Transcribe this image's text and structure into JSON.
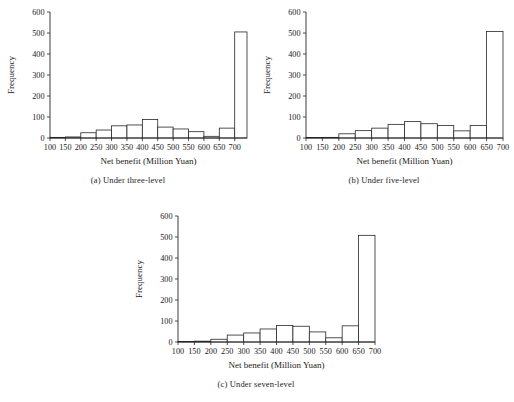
{
  "figure": {
    "panels": [
      {
        "id": "a",
        "caption": "(a) Under three-level",
        "chart_data": {
          "type": "bar",
          "title": "",
          "xlabel": "Net benefit (Million Yuan)",
          "ylabel": "Frequency",
          "xlim": [
            100,
            700
          ],
          "ylim": [
            0,
            600
          ],
          "ytick_labels": [
            "0",
            "100",
            "200",
            "300",
            "400",
            "500",
            "600"
          ],
          "yticks": [
            0,
            100,
            200,
            300,
            400,
            500,
            600
          ],
          "xtick_labels": [
            "100",
            "150",
            "200",
            "250",
            "300",
            "350",
            "400",
            "450",
            "500",
            "550",
            "600",
            "650",
            "700"
          ],
          "xticks": [
            100,
            150,
            200,
            250,
            300,
            350,
            400,
            450,
            500,
            550,
            600,
            650,
            700
          ],
          "bin_width": 50,
          "grid": false,
          "legend": "none",
          "bin_edges": [
            100,
            150,
            200,
            250,
            300,
            350,
            400,
            450,
            500,
            550,
            600,
            650,
            700
          ],
          "categories": [
            "100-150",
            "150-200",
            "200-250",
            "250-300",
            "300-350",
            "350-400",
            "400-450",
            "450-500",
            "500-550",
            "550-600",
            "600-650",
            "650-700"
          ],
          "values": [
            3,
            5,
            25,
            38,
            58,
            62,
            88,
            52,
            43,
            30,
            8,
            47,
            505
          ],
          "bars": [
            {
              "x0": 100,
              "x1": 150,
              "value": 3
            },
            {
              "x0": 150,
              "x1": 200,
              "value": 5
            },
            {
              "x0": 200,
              "x1": 250,
              "value": 25
            },
            {
              "x0": 250,
              "x1": 300,
              "value": 38
            },
            {
              "x0": 300,
              "x1": 350,
              "value": 58
            },
            {
              "x0": 350,
              "x1": 400,
              "value": 62
            },
            {
              "x0": 400,
              "x1": 450,
              "value": 88
            },
            {
              "x0": 450,
              "x1": 500,
              "value": 52
            },
            {
              "x0": 500,
              "x1": 550,
              "value": 43
            },
            {
              "x0": 550,
              "x1": 600,
              "value": 30
            },
            {
              "x0": 600,
              "x1": 650,
              "value": 8
            },
            {
              "x0": 650,
              "x1": 700,
              "value": 47
            },
            {
              "x0": 700,
              "x1": 740,
              "value": 505
            }
          ]
        }
      },
      {
        "id": "b",
        "caption": "(b) Under five-level",
        "chart_data": {
          "type": "bar",
          "title": "",
          "xlabel": "Net benefit (Million Yuan)",
          "ylabel": "Frequency",
          "xlim": [
            100,
            700
          ],
          "ylim": [
            0,
            600
          ],
          "ytick_labels": [
            "0",
            "100",
            "200",
            "300",
            "400",
            "500",
            "600"
          ],
          "yticks": [
            0,
            100,
            200,
            300,
            400,
            500,
            600
          ],
          "xtick_labels": [
            "100",
            "150",
            "200",
            "250",
            "300",
            "350",
            "400",
            "450",
            "500",
            "550",
            "600",
            "650",
            "700"
          ],
          "xticks": [
            100,
            150,
            200,
            250,
            300,
            350,
            400,
            450,
            500,
            550,
            600,
            650,
            700
          ],
          "bin_width": 50,
          "grid": false,
          "legend": "none",
          "bin_edges": [
            100,
            150,
            200,
            250,
            300,
            350,
            400,
            450,
            500,
            550,
            600,
            650,
            700
          ],
          "categories": [
            "100-150",
            "150-200",
            "200-250",
            "250-300",
            "300-350",
            "350-400",
            "400-450",
            "450-500",
            "500-550",
            "550-600",
            "600-650",
            "650-700"
          ],
          "values": [
            2,
            3,
            20,
            35,
            47,
            65,
            78,
            68,
            60,
            34,
            60,
            507
          ],
          "bars": [
            {
              "x0": 100,
              "x1": 150,
              "value": 2
            },
            {
              "x0": 150,
              "x1": 200,
              "value": 3
            },
            {
              "x0": 200,
              "x1": 250,
              "value": 20
            },
            {
              "x0": 250,
              "x1": 300,
              "value": 35
            },
            {
              "x0": 300,
              "x1": 350,
              "value": 47
            },
            {
              "x0": 350,
              "x1": 400,
              "value": 65
            },
            {
              "x0": 400,
              "x1": 450,
              "value": 78
            },
            {
              "x0": 450,
              "x1": 500,
              "value": 68
            },
            {
              "x0": 500,
              "x1": 550,
              "value": 60
            },
            {
              "x0": 550,
              "x1": 600,
              "value": 34
            },
            {
              "x0": 600,
              "x1": 650,
              "value": 60
            },
            {
              "x0": 650,
              "x1": 700,
              "value": 507
            }
          ]
        }
      },
      {
        "id": "c",
        "caption": "(c) Under seven-level",
        "chart_data": {
          "type": "bar",
          "title": "",
          "xlabel": "Net benefit (Million Yuan)",
          "ylabel": "Frequency",
          "xlim": [
            100,
            700
          ],
          "ylim": [
            0,
            600
          ],
          "ytick_labels": [
            "0",
            "100",
            "200",
            "300",
            "400",
            "500",
            "600"
          ],
          "yticks": [
            0,
            100,
            200,
            300,
            400,
            500,
            600
          ],
          "xtick_labels": [
            "100",
            "150",
            "200",
            "250",
            "300",
            "350",
            "400",
            "450",
            "500",
            "550",
            "600",
            "650",
            "700"
          ],
          "xticks": [
            100,
            150,
            200,
            250,
            300,
            350,
            400,
            450,
            500,
            550,
            600,
            650,
            700
          ],
          "bin_width": 50,
          "grid": false,
          "legend": "none",
          "bin_edges": [
            100,
            150,
            200,
            250,
            300,
            350,
            400,
            450,
            500,
            550,
            600,
            650,
            700
          ],
          "categories": [
            "100-150",
            "150-200",
            "200-250",
            "250-300",
            "300-350",
            "350-400",
            "400-450",
            "450-500",
            "500-550",
            "550-600",
            "600-650",
            "650-700"
          ],
          "values": [
            1,
            4,
            13,
            33,
            43,
            62,
            79,
            75,
            48,
            20,
            77,
            508
          ],
          "bars": [
            {
              "x0": 100,
              "x1": 150,
              "value": 1
            },
            {
              "x0": 150,
              "x1": 200,
              "value": 4
            },
            {
              "x0": 200,
              "x1": 250,
              "value": 13
            },
            {
              "x0": 250,
              "x1": 300,
              "value": 33
            },
            {
              "x0": 300,
              "x1": 350,
              "value": 43
            },
            {
              "x0": 350,
              "x1": 400,
              "value": 62
            },
            {
              "x0": 400,
              "x1": 450,
              "value": 79
            },
            {
              "x0": 450,
              "x1": 500,
              "value": 75
            },
            {
              "x0": 500,
              "x1": 550,
              "value": 48
            },
            {
              "x0": 550,
              "x1": 600,
              "value": 20
            },
            {
              "x0": 600,
              "x1": 650,
              "value": 77
            },
            {
              "x0": 650,
              "x1": 700,
              "value": 508
            }
          ]
        }
      }
    ]
  }
}
